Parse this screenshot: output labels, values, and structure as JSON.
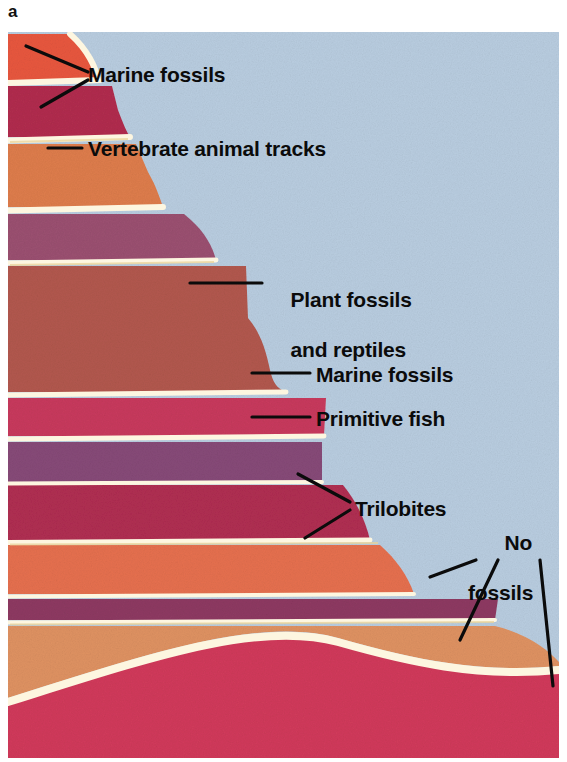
{
  "figure": {
    "panel_letter": "a",
    "type": "geologic-strata-cross-section",
    "background_color": "#ffffff",
    "sky_color": "#b9cde0",
    "line_color": "#0b0b0b",
    "band_separator_color": "#fdf6e0"
  },
  "labels": {
    "marine_fossils_top": "Marine fossils",
    "vertebrate_tracks": "Vertebrate animal tracks",
    "plant_fossils_line1": "Plant fossils",
    "plant_fossils_line2": "and reptiles",
    "marine_fossils_mid": "Marine fossils",
    "primitive_fish": "Primitive fish",
    "trilobites": "Trilobites",
    "no_fossils_line1": "No",
    "no_fossils_line2": "fossils"
  },
  "strata": [
    {
      "id": "layer-1",
      "name": "uppermost-orange-red-bed",
      "color": "#e8573f",
      "top": 2,
      "bottom": 48,
      "right_top": 92,
      "right_bottom": 80,
      "fossils": "Marine fossils"
    },
    {
      "id": "layer-2",
      "name": "crimson-bed",
      "color": "#b12d4e",
      "top": 54,
      "bottom": 105,
      "right_top": 104,
      "right_bottom": 120,
      "fossils": "Marine fossils"
    },
    {
      "id": "layer-3",
      "name": "orange-bed",
      "color": "#de7d4c",
      "top": 112,
      "bottom": 175,
      "right_top": 128,
      "right_bottom": 155,
      "fossils": "Vertebrate animal tracks"
    },
    {
      "id": "layer-4",
      "name": "mauve-purple-bed",
      "color": "#9b5071",
      "top": 182,
      "bottom": 228,
      "right_top": 176,
      "right_bottom": 200,
      "fossils": null
    },
    {
      "id": "layer-5",
      "name": "thick-brick-red-bed",
      "color": "#b2584e",
      "top": 234,
      "bottom": 360,
      "right_top": 238,
      "right_bottom": 278,
      "fossils": "Plant fossils and reptiles"
    },
    {
      "id": "layer-6",
      "name": "rose-red-bed",
      "color": "#c83a5d",
      "top": 366,
      "bottom": 404,
      "right_top": 318,
      "right_bottom": 314,
      "fossils": "Marine fossils"
    },
    {
      "id": "layer-7",
      "name": "deep-purple-bed",
      "color": "#874a78",
      "top": 410,
      "bottom": 450,
      "right_top": 314,
      "right_bottom": 312,
      "fossils": "Primitive fish"
    },
    {
      "id": "layer-8",
      "name": "dark-magenta-bed",
      "color": "#b02e52",
      "top": 453,
      "bottom": 508,
      "right_top": 335,
      "right_bottom": 312,
      "fossils": "Trilobites"
    },
    {
      "id": "layer-9",
      "name": "salmon-orange-bed",
      "color": "#e6704f",
      "top": 513,
      "bottom": 562,
      "right_top": 372,
      "right_bottom": 330,
      "fossils": "Trilobites"
    },
    {
      "id": "layer-10",
      "name": "thin-plum-bed",
      "color": "#8e3a62",
      "top": 567,
      "bottom": 588,
      "right_top": 490,
      "right_bottom": 487,
      "fossils": "No fossils"
    },
    {
      "id": "layer-11",
      "name": "tan-orange-basement-bed",
      "color": "#df9262",
      "top": 594,
      "bottom": 700,
      "right_top": 551,
      "right_bottom": 551,
      "fossils": "No fossils"
    },
    {
      "id": "layer-12",
      "name": "basal-crimson-bed",
      "color": "#d13a5b",
      "top": 660,
      "bottom": 726,
      "right_top": 551,
      "right_bottom": 551,
      "fossils": "No fossils"
    }
  ],
  "leader_lines": [
    {
      "name": "leader-marine-top",
      "x1": 88,
      "y1": 72,
      "x2": 25,
      "y2": 44
    },
    {
      "name": "leader-marine-top-2",
      "x1": 88,
      "y1": 80,
      "x2": 40,
      "y2": 107
    },
    {
      "name": "leader-vertebrate",
      "x1": 82,
      "y1": 148,
      "x2": 47,
      "y2": 148
    },
    {
      "name": "leader-plant",
      "x1": 262,
      "y1": 283,
      "x2": 190,
      "y2": 283
    },
    {
      "name": "leader-marine-mid",
      "x1": 310,
      "y1": 373,
      "x2": 252,
      "y2": 373
    },
    {
      "name": "leader-primitive",
      "x1": 310,
      "y1": 417,
      "x2": 252,
      "y2": 417
    },
    {
      "name": "leader-trilobites-1",
      "x1": 350,
      "y1": 502,
      "x2": 298,
      "y2": 474
    },
    {
      "name": "leader-trilobites-2",
      "x1": 350,
      "y1": 510,
      "x2": 305,
      "y2": 538
    },
    {
      "name": "leader-nofossils-1",
      "x1": 476,
      "y1": 560,
      "x2": 430,
      "y2": 577
    },
    {
      "name": "leader-nofossils-2",
      "x1": 498,
      "y1": 560,
      "x2": 460,
      "y2": 640
    },
    {
      "name": "leader-nofossils-3",
      "x1": 540,
      "y1": 560,
      "x2": 552,
      "y2": 686
    }
  ]
}
